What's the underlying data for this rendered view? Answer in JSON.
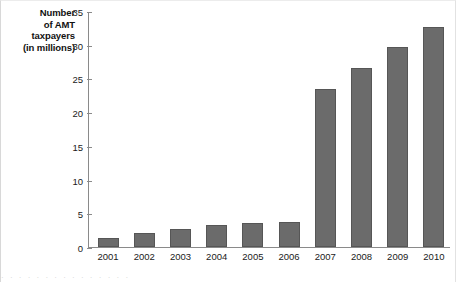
{
  "chart_data": {
    "type": "bar",
    "title": "",
    "xlabel": "",
    "ylabel": "Number of AMT taxpayers (in millions)",
    "ylabel_lines": [
      "Number",
      "of AMT",
      "taxpayers",
      "(in millions)"
    ],
    "categories": [
      "2001",
      "2002",
      "2003",
      "2004",
      "2005",
      "2006",
      "2007",
      "2008",
      "2009",
      "2010"
    ],
    "values": [
      1.4,
      2.1,
      2.6,
      3.3,
      3.6,
      3.7,
      23.4,
      26.6,
      29.6,
      32.6
    ],
    "ylim": [
      0,
      35
    ],
    "ytick_values": [
      0,
      5,
      10,
      15,
      20,
      25,
      30,
      35
    ],
    "ytick_labels": [
      "0",
      "5",
      "10",
      "15",
      "20",
      "25",
      "30",
      "35"
    ],
    "grid": false,
    "legend": null,
    "bar_color": "#6b6b6b",
    "bar_edge_color": "#565656",
    "axis_color": "#8a8a8a"
  },
  "figure": {
    "background": "#ffffff",
    "footer_smudge": "·  ·   ·    ·     ·    ·  ·     ·   ·  ·    ·     ·   ·  ·    ·"
  }
}
